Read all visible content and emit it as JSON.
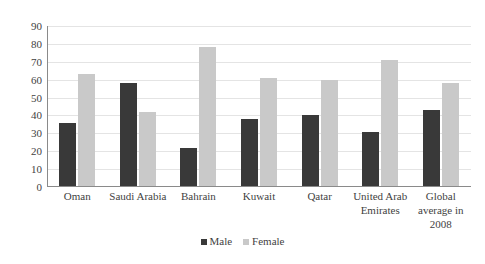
{
  "chart_data": {
    "type": "bar",
    "title": "",
    "subtitle": "",
    "xlabel": "",
    "ylabel": "",
    "ylim": [
      0,
      90
    ],
    "ytick_step": 10,
    "yticks": [
      90,
      80,
      70,
      60,
      50,
      40,
      30,
      20,
      10,
      0
    ],
    "grid": true,
    "legend_position": "bottom-center",
    "categories": [
      "Oman",
      "Saudi Arabia",
      "Bahrain",
      "Kuwait",
      "Qatar",
      "United Arab Emirates",
      "Global average in 2008"
    ],
    "series": [
      {
        "name": "Male",
        "color": "#393939",
        "values": [
          36,
          58,
          22,
          38,
          40,
          31,
          43
        ]
      },
      {
        "name": "Female",
        "color": "#c9c9c9",
        "values": [
          63,
          42,
          78,
          61,
          60,
          71,
          58
        ]
      }
    ]
  },
  "colors": {
    "male": "#393939",
    "female": "#c9c9c9",
    "axis": "#8a8a8a",
    "grid": "#e4e4e4",
    "text": "#3f3f3f",
    "background": "#ffffff"
  }
}
